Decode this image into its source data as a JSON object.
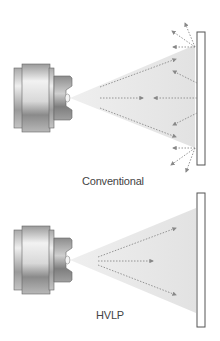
{
  "diagrams": [
    {
      "id": "conventional",
      "label": "Conventional",
      "description": "Spray gun nozzle emitting a wide spray cone at a flat panel with many particles bouncing back (overspray)."
    },
    {
      "id": "hvlp",
      "label": "HVLP",
      "description": "Spray gun nozzle emitting a spray cone at a flat panel with particles traveling toward the panel and no bounce-back."
    }
  ],
  "icons": {
    "spray_nozzle": "spray-gun-nozzle-icon",
    "panel": "target-panel-icon",
    "arrow": "dotted-arrow-icon"
  },
  "colors": {
    "spray_cone": "#e6e6e6",
    "arrow": "#8a8a8a",
    "panel_border": "#555555",
    "nozzle_dark": "#7a7a7a",
    "nozzle_light": "#e8e8e8"
  }
}
